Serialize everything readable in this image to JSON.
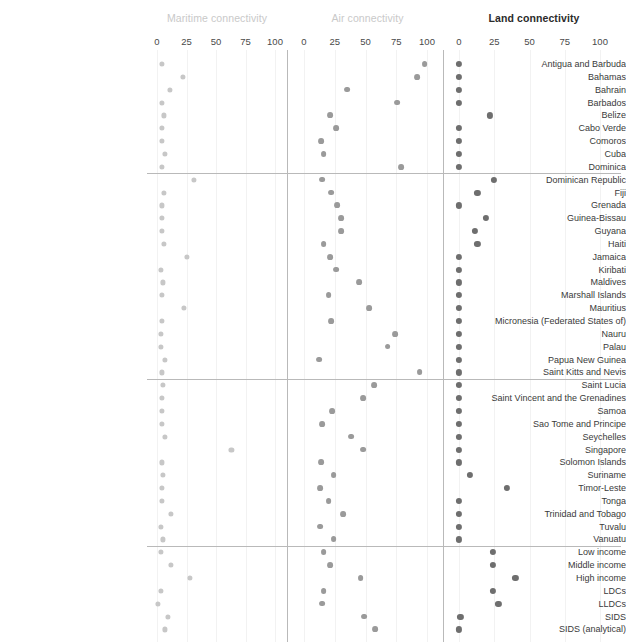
{
  "chart_data": {
    "type": "scatter",
    "title": "",
    "xlabel": "",
    "ylabel": "",
    "xlim": [
      0,
      100
    ],
    "grid": true,
    "legend_position": "none",
    "panels": [
      {
        "key": "maritime",
        "label": "Maritime connectivity",
        "emphasis": "faded",
        "color": "#c7c7c7",
        "ticks": [
          0,
          25,
          50,
          75,
          100
        ]
      },
      {
        "key": "air",
        "label": "Air connectivity",
        "emphasis": "faded",
        "color": "#9a9a9a",
        "ticks": [
          0,
          25,
          50,
          75,
          100
        ]
      },
      {
        "key": "land",
        "label": "Land connectivity",
        "emphasis": "strong",
        "color": "#6e6e6e",
        "ticks": [
          0,
          25,
          50,
          75,
          100
        ]
      }
    ],
    "group_breaks_after": [
      "Dominica",
      "Saint Kitts and Nevis",
      "Vanuatu"
    ],
    "categories": [
      "Antigua and Barbuda",
      "Bahamas",
      "Bahrain",
      "Barbados",
      "Belize",
      "Cabo Verde",
      "Comoros",
      "Cuba",
      "Dominica",
      "Dominican Republic",
      "Fiji",
      "Grenada",
      "Guinea-Bissau",
      "Guyana",
      "Haiti",
      "Jamaica",
      "Kiribati",
      "Maldives",
      "Marshall Islands",
      "Mauritius",
      "Micronesia (Federated States of)",
      "Nauru",
      "Palau",
      "Papua New Guinea",
      "Saint Kitts and Nevis",
      "Saint Lucia",
      "Saint Vincent and the Grenadines",
      "Samoa",
      "Sao Tome and Principe",
      "Seychelles",
      "Singapore",
      "Solomon Islands",
      "Suriname",
      "Timor-Leste",
      "Tonga",
      "Trinidad and Tobago",
      "Tuvalu",
      "Vanuatu",
      "Low income",
      "Middle income",
      "High income",
      "LDCs",
      "LLDCs",
      "SIDS",
      "SIDS (analytical)"
    ],
    "series": [
      {
        "name": "Maritime connectivity",
        "key": "maritime",
        "values": [
          4,
          22,
          11,
          4,
          6,
          4,
          4,
          7,
          4,
          31,
          6,
          4,
          4,
          4,
          6,
          25,
          3,
          5,
          4,
          23,
          4,
          3,
          3,
          7,
          4,
          5,
          4,
          4,
          4,
          7,
          63,
          4,
          5,
          4,
          4,
          12,
          3,
          5,
          3,
          12,
          28,
          3,
          1,
          9,
          7
        ]
      },
      {
        "name": "Air connectivity",
        "key": "air",
        "values": [
          98,
          92,
          35,
          76,
          21,
          26,
          14,
          16,
          79,
          15,
          22,
          27,
          30,
          30,
          16,
          21,
          26,
          45,
          20,
          53,
          22,
          74,
          68,
          12,
          94,
          57,
          48,
          23,
          15,
          38,
          48,
          14,
          24,
          13,
          20,
          32,
          13,
          24,
          16,
          21,
          46,
          16,
          15,
          49,
          58
        ]
      },
      {
        "name": "Land connectivity",
        "key": "land",
        "values": [
          0,
          0,
          0,
          0,
          22,
          0,
          0,
          0,
          0,
          25,
          13,
          0,
          19,
          11,
          13,
          0,
          0,
          0,
          0,
          0,
          0,
          0,
          0,
          0,
          0,
          0,
          0,
          0,
          0,
          0,
          0,
          0,
          8,
          34,
          0,
          0,
          0,
          0,
          24,
          24,
          40,
          24,
          28,
          1,
          0
        ]
      }
    ]
  }
}
